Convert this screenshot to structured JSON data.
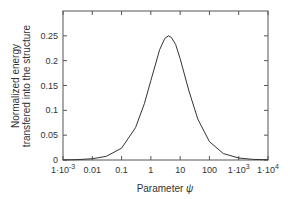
{
  "chart_data": {
    "type": "line",
    "title": "",
    "xlabel": "Parameter ψ",
    "ylabel_line1": "Normalized energy",
    "ylabel_line2": "transfered into the structure",
    "xscale": "log",
    "xlim": [
      0.001,
      10000
    ],
    "ylim": [
      0,
      0.3
    ],
    "grid": false,
    "legend": null,
    "x_ticks": [
      {
        "value": 0.001,
        "label": "1·10",
        "sup": "-3"
      },
      {
        "value": 0.01,
        "label": "0.01",
        "sup": ""
      },
      {
        "value": 0.1,
        "label": "0.1",
        "sup": ""
      },
      {
        "value": 1,
        "label": "1",
        "sup": ""
      },
      {
        "value": 10,
        "label": "10",
        "sup": ""
      },
      {
        "value": 100,
        "label": "100",
        "sup": ""
      },
      {
        "value": 1000,
        "label": "1·10",
        "sup": "3"
      },
      {
        "value": 10000,
        "label": "1·10",
        "sup": "4"
      }
    ],
    "y_ticks": [
      {
        "value": 0,
        "label": "0"
      },
      {
        "value": 0.05,
        "label": "0.05"
      },
      {
        "value": 0.1,
        "label": "0.1"
      },
      {
        "value": 0.15,
        "label": "0.15"
      },
      {
        "value": 0.2,
        "label": "0.2"
      },
      {
        "value": 0.25,
        "label": "0.25"
      }
    ],
    "series": [
      {
        "name": "energy",
        "color": "#333333",
        "x": [
          0.001,
          0.003,
          0.01,
          0.03,
          0.1,
          0.3,
          0.6,
          1,
          2,
          3,
          4,
          5,
          7,
          10,
          20,
          40,
          100,
          300,
          1000,
          3000,
          10000
        ],
        "y": [
          0.0002,
          0.0007,
          0.0025,
          0.0074,
          0.0238,
          0.0651,
          0.1134,
          0.16,
          0.2222,
          0.2449,
          0.25,
          0.2469,
          0.2327,
          0.2041,
          0.1389,
          0.0826,
          0.037,
          0.0129,
          0.004,
          0.0013,
          0.0004
        ]
      }
    ]
  }
}
